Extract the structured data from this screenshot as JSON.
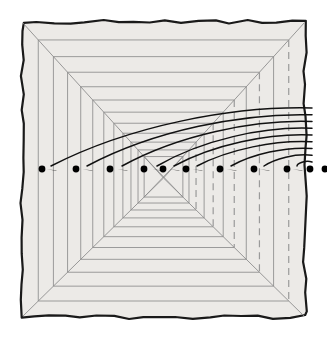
{
  "figure": {
    "name": "perspective-corridor-illusion",
    "title": "",
    "caption": "",
    "canvas": {
      "width": 327,
      "height": 337
    },
    "colors": {
      "page_background": "#ffffff",
      "panel_fill": "#eceae7",
      "panel_border": "#1a1a1a",
      "perspective_line": "#8d8d8d",
      "dashed_line": "#9a9a9a",
      "arrow_stroke": "#111111",
      "dot_fill": "#000000"
    },
    "panel": {
      "x": 22,
      "y": 22,
      "width": 283,
      "height": 295,
      "border_width": 2.2,
      "hand_drawn": true,
      "wobble_amplitude": 2.0
    },
    "vanishing_point": {
      "x": 163.5,
      "y": 178
    },
    "horizon_y": 169,
    "nested_rectangles": {
      "count": 12,
      "scales": [
        1.0,
        0.885,
        0.778,
        0.678,
        0.585,
        0.5,
        0.422,
        0.351,
        0.287,
        0.23,
        0.18,
        0.137
      ],
      "note": "fractions of the panel, shrinking toward the vanishing point"
    },
    "diagonals": {
      "count": 4,
      "description": "corner-to-vanishing-point rays from each panel corner"
    },
    "left_wall": {
      "vertical_line_count": 11,
      "style": "solid"
    },
    "right_wall": {
      "vertical_line_count": 11,
      "style": "alternating-solid-and-dashed",
      "dash_pattern": "7 5"
    },
    "ceiling": {
      "horizontal_line_count": 11,
      "style": "solid"
    },
    "floor": {
      "horizontal_line_count": 11,
      "style": "solid"
    },
    "dots": {
      "count": 11,
      "radius": 3.4,
      "y": 169,
      "x_positions": [
        42,
        76,
        110,
        144,
        163,
        186,
        220,
        254,
        287,
        310,
        325
      ]
    },
    "arrows": {
      "count": 9,
      "stroke_width": 1.5,
      "head_length": 10,
      "head_width": 7,
      "direction": "right-to-left",
      "description": "curved arcs sweeping in from the right edge, each terminating in a filled arrowhead aimed at a dot on the horizon",
      "targets_x": [
        44,
        80,
        115,
        150,
        167,
        190,
        224,
        257,
        290
      ],
      "origin_x": 312,
      "origin_y_range": [
        108,
        162
      ]
    }
  }
}
